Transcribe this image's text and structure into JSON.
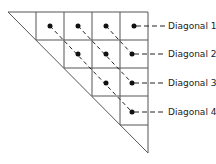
{
  "diagram": {
    "type": "triangular-grid",
    "labels": [
      "Diagonal 1",
      "Diagonal 2",
      "Diagonal 3",
      "Diagonal 4"
    ],
    "colors": {
      "line": "#555555",
      "dot": "#111111",
      "text": "#222222"
    }
  }
}
